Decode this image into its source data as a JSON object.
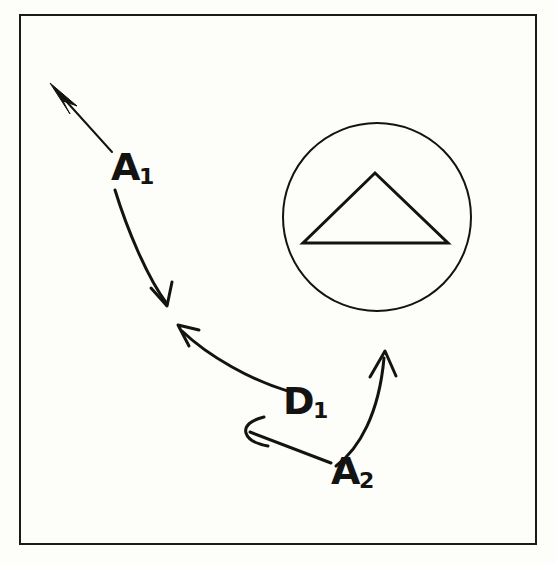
{
  "figure": {
    "kind": "line-diagram",
    "background_color": "#fdfdfa",
    "ink_color": "#131311",
    "frame": {
      "name": "outer-border",
      "x": 19,
      "y": 14,
      "width": 518,
      "height": 531,
      "stroke_width": 2
    }
  },
  "labels": {
    "a1": {
      "base": "A",
      "sub": "1"
    },
    "d1": {
      "base": "D",
      "sub": "1"
    },
    "a2": {
      "base": "A",
      "sub": "2"
    }
  },
  "shapes": {
    "circle": {
      "name": "circle-outline",
      "cx": 377,
      "cy": 217,
      "r": 94,
      "stroke_width": 2,
      "fill": "none"
    },
    "triangle": {
      "name": "triangle-outline",
      "points": "375,173 448,243 303,243",
      "stroke_width": 3,
      "fill": "none"
    }
  },
  "arrows": [
    {
      "name": "arrow-a1-upper",
      "style": "solid-filled-head",
      "from": [
        112,
        152
      ],
      "to": [
        52,
        86
      ],
      "path": "M 112 152 L 64 99",
      "head": "57,84 76,107 66,95 71,110",
      "stroke_width": 2
    },
    {
      "name": "arrow-a1-lower",
      "style": "open-v-head",
      "from": [
        115,
        190
      ],
      "to": [
        166,
        306
      ],
      "path": "M 115 190 C 126 228 146 276 166 303",
      "head": "M 151 289 L 167 306 L 171 283",
      "stroke_width": 3
    },
    {
      "name": "arrow-d1-to-upper-left",
      "style": "open-v-head",
      "from": [
        289,
        391
      ],
      "to": [
        178,
        326
      ],
      "path": "M 289 391 C 252 380 208 355 181 330",
      "head": "M 198 330 L 178 326 L 188 345",
      "stroke_width": 3
    },
    {
      "name": "arrow-a2-to-left",
      "style": "open-curl-head",
      "from": [
        331,
        463
      ],
      "to": [
        245,
        431
      ],
      "path": "M 331 463 L 249 432",
      "head": "M 262 418 C 250 421 244 427 246 433 C 248 439 256 443 266 445",
      "stroke_width": 3
    },
    {
      "name": "arrow-a2-to-circle",
      "style": "open-v-head",
      "from": [
        335,
        465
      ],
      "to": [
        385,
        352
      ],
      "path": "M 335 465 C 358 448 378 415 384 356",
      "head": "M 370 376 L 385 352 L 396 375",
      "stroke_width": 3
    }
  ]
}
